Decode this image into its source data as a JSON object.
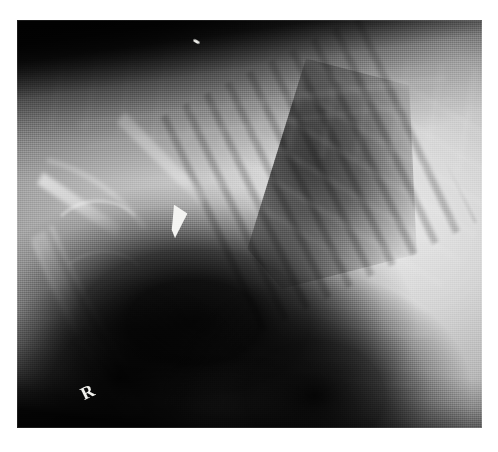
{
  "image": {
    "kind": "radiograph",
    "modality": "X-ray",
    "view": "lateral thorax / cranial abdomen",
    "subject": "veterinary patient",
    "background_color": "#ffffff",
    "film": {
      "left": 17,
      "top": 20,
      "width": 465,
      "height": 408,
      "base_color": "#b4b4b4",
      "dark_color": "#050505",
      "bright_color": "#e2e2e2"
    }
  },
  "markers": {
    "side_marker": {
      "letter": "R",
      "meaning": "right lateral recumbency marker",
      "color": "#f2f2ee"
    },
    "metal_wedge": {
      "label": "radiopaque wedge artifact",
      "color": "#f4f4f2"
    },
    "speck": {
      "label": "bright speck artifact",
      "color": "#eeeeea"
    }
  },
  "regions": [
    {
      "name": "top-collimation-band",
      "tone": "very dark",
      "location": "upper edge, fading diagonally to the right"
    },
    {
      "name": "spine-band",
      "tone": "light grey",
      "location": "upper third, running left to right"
    },
    {
      "name": "lung-field",
      "tone": "dark triangular",
      "location": "upper right of centre, with rib striations"
    },
    {
      "name": "rib-striations",
      "tone": "alternating dark/light bands",
      "location": "over the lung field"
    },
    {
      "name": "scapula-humerus",
      "tone": "bright linear bone",
      "location": "left side, running top-left to bottom"
    },
    {
      "name": "gas-void",
      "tone": "near black",
      "location": "lower centre-left"
    },
    {
      "name": "soft-tissue-dome",
      "tone": "bright",
      "location": "right side, diaphragm / abdominal mass"
    },
    {
      "name": "bottom-collimation-band",
      "tone": "very dark",
      "location": "lower edge"
    }
  ]
}
